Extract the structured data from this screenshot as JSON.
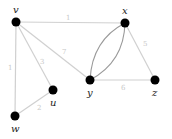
{
  "graph": {
    "nodes": [
      {
        "id": "v",
        "label": "v",
        "x": 16,
        "y": 22
      },
      {
        "id": "x",
        "label": "x",
        "x": 125,
        "y": 23
      },
      {
        "id": "y",
        "label": "y",
        "x": 90,
        "y": 80
      },
      {
        "id": "z",
        "label": "z",
        "x": 155,
        "y": 80
      },
      {
        "id": "u",
        "label": "u",
        "x": 53,
        "y": 90
      },
      {
        "id": "w",
        "label": "w",
        "x": 15,
        "y": 116
      }
    ],
    "edges": [
      {
        "from": "v",
        "to": "x",
        "weight": "1"
      },
      {
        "from": "v",
        "to": "w",
        "weight": "1"
      },
      {
        "from": "v",
        "to": "u",
        "weight": "3"
      },
      {
        "from": "v",
        "to": "y",
        "weight": "7"
      },
      {
        "from": "x",
        "to": "z",
        "weight": "5"
      },
      {
        "from": "y",
        "to": "z",
        "weight": "6"
      },
      {
        "from": "u",
        "to": "w",
        "weight": "2"
      },
      {
        "from": "x",
        "to": "y",
        "weight": "",
        "curved": "left"
      },
      {
        "from": "x",
        "to": "y",
        "weight": "",
        "curved": "right"
      }
    ]
  }
}
